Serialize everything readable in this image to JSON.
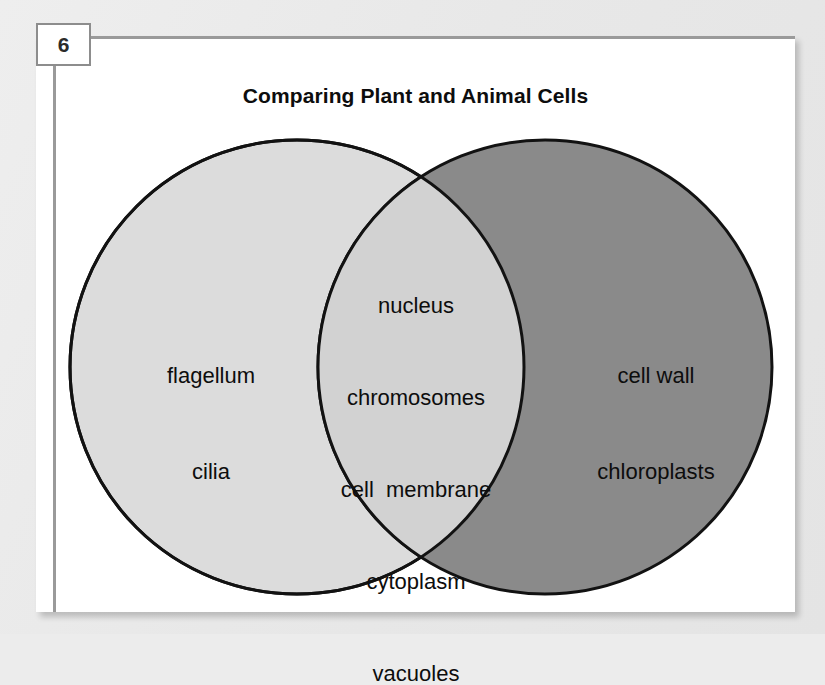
{
  "badge": {
    "number": "6"
  },
  "card": {
    "title": "Comparing Plant and Animal Cells"
  },
  "diagram": {
    "type": "venn",
    "left": {
      "caption": "Animal  Cell",
      "fill_color": "#dcdcdc",
      "stroke_color": "#121212",
      "items": [
        "flagellum",
        "cilia"
      ]
    },
    "right": {
      "caption": "Plant  Cell",
      "fill_color": "#8a8a8a",
      "stroke_color": "#121212",
      "items": [
        "cell wall",
        "chloroplasts"
      ]
    },
    "intersection": {
      "fill_color": "#d2d2d2",
      "items": [
        "nucleus",
        "chromosomes",
        "cell  membrane",
        "cytoplasm",
        "vacuoles"
      ]
    }
  },
  "colors": {
    "page_background": "#ececec",
    "card_background": "#ffffff",
    "badge_border": "#8d8d8d",
    "rule": "#9a9a9a",
    "text": "#0d0d0d"
  }
}
